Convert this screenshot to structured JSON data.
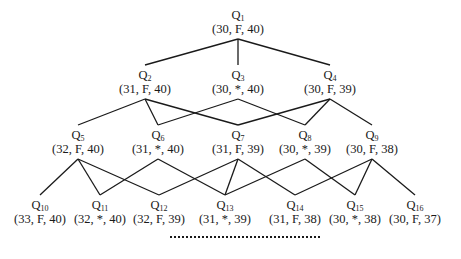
{
  "diagram": {
    "type": "lattice",
    "line_color": "#1a1a1a",
    "nodes": [
      {
        "id": "Q1",
        "label": "Q",
        "sub": "1",
        "tuple": "(30, F, 40)",
        "x": 238,
        "y": 8
      },
      {
        "id": "Q2",
        "label": "Q",
        "sub": "2",
        "tuple": "(31, F, 40)",
        "x": 145,
        "y": 68
      },
      {
        "id": "Q3",
        "label": "Q",
        "sub": "3",
        "tuple": "(30, *, 40)",
        "x": 238,
        "y": 68
      },
      {
        "id": "Q4",
        "label": "Q",
        "sub": "4",
        "tuple": "(30, F, 39)",
        "x": 330,
        "y": 68
      },
      {
        "id": "Q5",
        "label": "Q",
        "sub": "5",
        "tuple": "(32, F, 40)",
        "x": 78,
        "y": 128
      },
      {
        "id": "Q6",
        "label": "Q",
        "sub": "6",
        "tuple": "(31, *, 40)",
        "x": 158,
        "y": 128
      },
      {
        "id": "Q7",
        "label": "Q",
        "sub": "7",
        "tuple": "(31, F, 39)",
        "x": 238,
        "y": 128
      },
      {
        "id": "Q8",
        "label": "Q",
        "sub": "8",
        "tuple": "(30, *, 39)",
        "x": 305,
        "y": 128
      },
      {
        "id": "Q9",
        "label": "Q",
        "sub": "9",
        "tuple": "(30, F, 38)",
        "x": 372,
        "y": 128
      },
      {
        "id": "Q10",
        "label": "Q",
        "sub": "10",
        "tuple": "(33, F, 40)",
        "x": 40,
        "y": 198
      },
      {
        "id": "Q11",
        "label": "Q",
        "sub": "11",
        "tuple": "(32, *, 40)",
        "x": 100,
        "y": 198
      },
      {
        "id": "Q12",
        "label": "Q",
        "sub": "12",
        "tuple": "(32, F, 39)",
        "x": 159,
        "y": 198
      },
      {
        "id": "Q13",
        "label": "Q",
        "sub": "13",
        "tuple": "(31, *, 39)",
        "x": 225,
        "y": 198
      },
      {
        "id": "Q14",
        "label": "Q",
        "sub": "14",
        "tuple": "(31, F, 38)",
        "x": 295,
        "y": 198
      },
      {
        "id": "Q15",
        "label": "Q",
        "sub": "15",
        "tuple": "(30, *, 38)",
        "x": 355,
        "y": 198
      },
      {
        "id": "Q16",
        "label": "Q",
        "sub": "16",
        "tuple": "(30, F, 37)",
        "x": 415,
        "y": 198
      }
    ],
    "edges": [
      [
        "Q1",
        "Q2"
      ],
      [
        "Q1",
        "Q3"
      ],
      [
        "Q1",
        "Q4"
      ],
      [
        "Q2",
        "Q5"
      ],
      [
        "Q2",
        "Q6"
      ],
      [
        "Q2",
        "Q7"
      ],
      [
        "Q3",
        "Q6"
      ],
      [
        "Q3",
        "Q8"
      ],
      [
        "Q4",
        "Q7"
      ],
      [
        "Q4",
        "Q8"
      ],
      [
        "Q4",
        "Q9"
      ],
      [
        "Q5",
        "Q10"
      ],
      [
        "Q5",
        "Q11"
      ],
      [
        "Q5",
        "Q12"
      ],
      [
        "Q6",
        "Q11"
      ],
      [
        "Q6",
        "Q13"
      ],
      [
        "Q7",
        "Q12"
      ],
      [
        "Q7",
        "Q13"
      ],
      [
        "Q7",
        "Q14"
      ],
      [
        "Q8",
        "Q13"
      ],
      [
        "Q8",
        "Q15"
      ],
      [
        "Q9",
        "Q14"
      ],
      [
        "Q9",
        "Q15"
      ],
      [
        "Q9",
        "Q16"
      ]
    ],
    "continuation": "dotted-line"
  }
}
